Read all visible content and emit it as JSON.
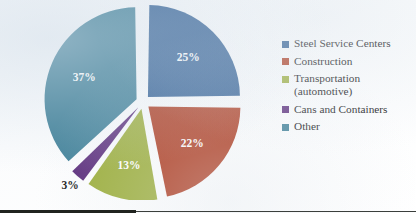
{
  "chart_data": {
    "type": "pie",
    "title": "",
    "subtitle": "",
    "exploded": true,
    "legend_position": "right",
    "grid": false,
    "categories": [
      "Steel Service Centers",
      "Construction",
      "Transportation (automotive)",
      "Cans and Containers",
      "Other"
    ],
    "values": [
      25,
      22,
      13,
      3,
      37
    ],
    "unit": "%",
    "data_labels": [
      "25%",
      "22%",
      "13%",
      "3%",
      "37%"
    ],
    "colors": [
      "#2D5C92",
      "#AE3A1E",
      "#9CAE3B",
      "#5C2E7C",
      "#3E7F97"
    ],
    "slices": [
      {
        "label": "Steel Service Centers",
        "value": 25,
        "data_label": "25%",
        "color": "#2D5C92",
        "label_color": "#ffffff",
        "label_inside": true
      },
      {
        "label": "Construction",
        "value": 22,
        "data_label": "22%",
        "color": "#AE3A1E",
        "label_color": "#ffffff",
        "label_inside": true
      },
      {
        "label": "Transportation (automotive)",
        "value": 13,
        "data_label": "13%",
        "color": "#9CAE3B",
        "label_color": "#ffffff",
        "label_inside": true
      },
      {
        "label": "Cans and Containers",
        "value": 3,
        "data_label": "3%",
        "color": "#5C2E7C",
        "label_color": "#1a1a1a",
        "label_inside": false
      },
      {
        "label": "Other",
        "value": 37,
        "data_label": "37%",
        "color": "#3E7F97",
        "label_color": "#ffffff",
        "label_inside": true
      }
    ],
    "xlabel": "",
    "ylabel": ""
  },
  "legend": {
    "items": [
      {
        "label": "Steel Service Centers",
        "color": "#2D5C92"
      },
      {
        "label": "Construction",
        "color": "#AE3A1E"
      },
      {
        "label": "Transportation\n(automotive)",
        "color": "#9CAE3B"
      },
      {
        "label": "Cans and Containers",
        "color": "#5C2E7C"
      },
      {
        "label": "Other",
        "color": "#3E7F97"
      }
    ]
  },
  "labels": {
    "slice_1": "25%",
    "slice_2": "22%",
    "slice_3": "13%",
    "slice_4": "3%",
    "slice_5": "37%"
  }
}
